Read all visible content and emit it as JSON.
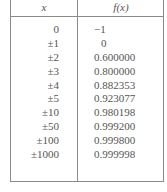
{
  "table": {
    "headers": {
      "x": "x",
      "fx": "f(x)"
    },
    "rows": [
      {
        "x": "0",
        "fx": "−1"
      },
      {
        "x": "±1",
        "fx": "0"
      },
      {
        "x": "±2",
        "fx": "0.600000"
      },
      {
        "x": "±3",
        "fx": "0.800000"
      },
      {
        "x": "±4",
        "fx": "0.882353"
      },
      {
        "x": "±5",
        "fx": "0.923077"
      },
      {
        "x": "±10",
        "fx": "0.980198"
      },
      {
        "x": "±50",
        "fx": "0.999200"
      },
      {
        "x": "±100",
        "fx": "0.999800"
      },
      {
        "x": "±1000",
        "fx": "0.999998"
      }
    ]
  }
}
